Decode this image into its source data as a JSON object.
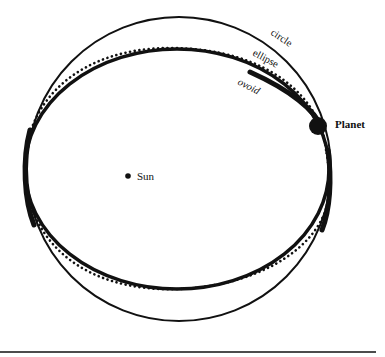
{
  "diagram": {
    "orbits": [
      {
        "name": "circle",
        "label": "circle",
        "style": "solid-thin"
      },
      {
        "name": "ellipse",
        "label": "ellipse",
        "style": "solid-thick"
      },
      {
        "name": "ovoid",
        "label": "ovoid",
        "style": "dotted"
      }
    ],
    "bodies": {
      "sun_label": "Sun",
      "planet_label": "Planet"
    },
    "colors": {
      "ink": "#111111",
      "background": "#ffffff"
    }
  }
}
